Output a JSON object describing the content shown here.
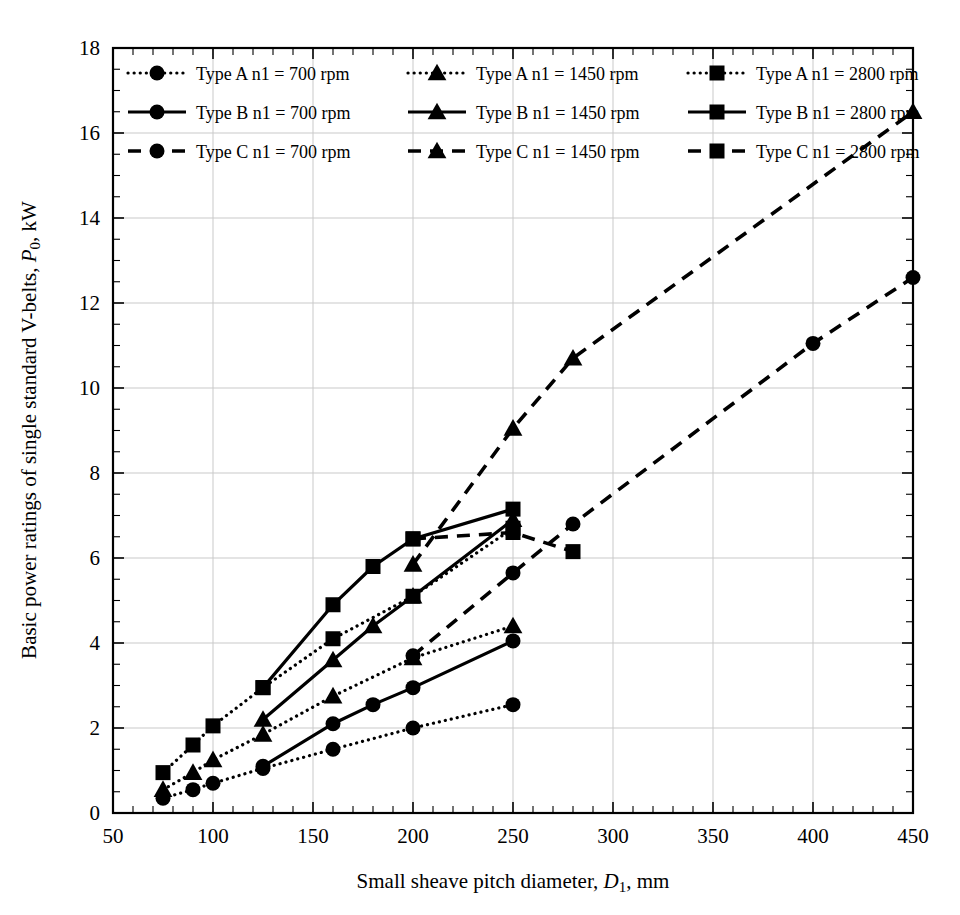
{
  "chart_data": {
    "type": "line",
    "title": "",
    "xlabel": "Small sheave pitch diameter, D₁, mm",
    "ylabel": "Basic power ratings of single standard V-belts, P₀, kW",
    "xlim": [
      50,
      450
    ],
    "ylim": [
      0,
      18
    ],
    "xticks": [
      50,
      100,
      150,
      200,
      250,
      300,
      350,
      400,
      450
    ],
    "yticks": [
      0,
      2,
      4,
      6,
      8,
      10,
      12,
      14,
      16,
      18
    ],
    "x_minor_step": 10,
    "y_minor_step": 0.5,
    "grid": true,
    "legend_position": "top-inside",
    "series": [
      {
        "name": "Type A n1 = 700 rpm",
        "belt_type": "A",
        "speed_rpm": 700,
        "marker": "circle",
        "dash": "dotted",
        "x": [
          75,
          90,
          100,
          125,
          160,
          200,
          250
        ],
        "y": [
          0.35,
          0.55,
          0.7,
          1.05,
          1.5,
          2.0,
          2.55
        ]
      },
      {
        "name": "Type A n1 = 1450 rpm",
        "belt_type": "A",
        "speed_rpm": 1450,
        "marker": "triangle",
        "dash": "dotted",
        "x": [
          75,
          90,
          100,
          125,
          160,
          200,
          250
        ],
        "y": [
          0.55,
          0.95,
          1.25,
          1.85,
          2.75,
          3.65,
          4.4
        ]
      },
      {
        "name": "Type A n1 = 2800 rpm",
        "belt_type": "A",
        "speed_rpm": 2800,
        "marker": "square",
        "dash": "dotted",
        "x": [
          75,
          90,
          100,
          125,
          160,
          200,
          250
        ],
        "y": [
          0.95,
          1.6,
          2.05,
          2.95,
          4.1,
          5.1,
          6.7
        ]
      },
      {
        "name": "Type B n1 = 700 rpm",
        "belt_type": "B",
        "speed_rpm": 700,
        "marker": "circle",
        "dash": "solid",
        "x": [
          125,
          160,
          180,
          200,
          250
        ],
        "y": [
          1.1,
          2.1,
          2.55,
          2.95,
          4.05
        ]
      },
      {
        "name": "Type B n1 = 1450 rpm",
        "belt_type": "B",
        "speed_rpm": 1450,
        "marker": "triangle",
        "dash": "solid",
        "x": [
          125,
          160,
          180,
          200,
          250
        ],
        "y": [
          2.2,
          3.6,
          4.4,
          5.1,
          6.9
        ]
      },
      {
        "name": "Type B n1 = 2800 rpm",
        "belt_type": "B",
        "speed_rpm": 2800,
        "marker": "square",
        "dash": "solid",
        "x": [
          125,
          160,
          180,
          200,
          250
        ],
        "y": [
          2.95,
          4.9,
          5.8,
          6.45,
          7.15
        ]
      },
      {
        "name": "Type C n1 = 700 rpm",
        "belt_type": "C",
        "speed_rpm": 700,
        "marker": "circle",
        "dash": "dashed",
        "x": [
          200,
          250,
          280,
          400,
          450
        ],
        "y": [
          3.7,
          5.65,
          6.8,
          11.05,
          12.6
        ]
      },
      {
        "name": "Type C n1 = 1450 rpm",
        "belt_type": "C",
        "speed_rpm": 1450,
        "marker": "triangle",
        "dash": "dashed",
        "x": [
          200,
          250,
          280,
          450
        ],
        "y": [
          5.85,
          9.05,
          10.7,
          16.5
        ]
      },
      {
        "name": "Type C n1 = 2800 rpm",
        "belt_type": "C",
        "speed_rpm": 2800,
        "marker": "square",
        "dash": "dashed",
        "x": [
          200,
          250,
          280
        ],
        "y": [
          6.45,
          6.6,
          6.15
        ]
      }
    ]
  },
  "axes": {
    "y_title": "Basic power ratings of single standard V-belts, P₀, kW",
    "y_title_main": "Basic power ratings of single standard V-belts, ",
    "y_title_italic": "P",
    "y_title_sub": "0",
    "y_title_tail": ", kW",
    "x_title_main": "Small sheave pitch diameter, ",
    "x_title_italic": "D",
    "x_title_sub": "1",
    "x_title_tail": ", mm",
    "x_tick_labels": [
      "50",
      "100",
      "150",
      "200",
      "250",
      "300",
      "350",
      "400",
      "450"
    ],
    "y_tick_labels": [
      "0",
      "2",
      "4",
      "6",
      "8",
      "10",
      "12",
      "14",
      "16",
      "18"
    ]
  },
  "legend": {
    "entries": [
      {
        "label": "Type A n1 = 700 rpm",
        "marker": "circle",
        "dash": "dotted"
      },
      {
        "label": "Type A n1 = 1450 rpm",
        "marker": "triangle",
        "dash": "dotted"
      },
      {
        "label": "Type A n1 = 2800 rpm",
        "marker": "square",
        "dash": "dotted"
      },
      {
        "label": "Type B n1 = 700 rpm",
        "marker": "circle",
        "dash": "solid"
      },
      {
        "label": "Type B n1 = 1450 rpm",
        "marker": "triangle",
        "dash": "solid"
      },
      {
        "label": "Type B n1 = 2800 rpm",
        "marker": "square",
        "dash": "solid"
      },
      {
        "label": "Type C n1 = 700 rpm",
        "marker": "circle",
        "dash": "dashed"
      },
      {
        "label": "Type C n1 = 1450 rpm",
        "marker": "triangle",
        "dash": "dashed"
      },
      {
        "label": "Type C n1 = 2800 rpm",
        "marker": "square",
        "dash": "dashed"
      }
    ]
  },
  "colors": {
    "ink": "#000000",
    "grid": "#c9c9c9",
    "background": "#ffffff"
  }
}
